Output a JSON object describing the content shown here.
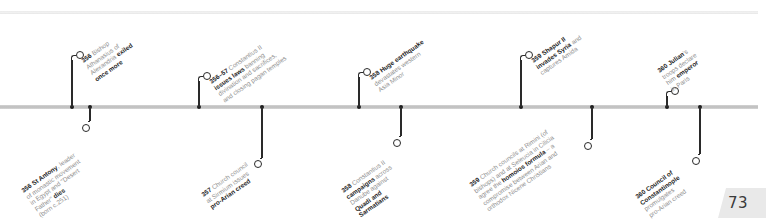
{
  "page": {
    "number": "73"
  },
  "timeline": {
    "above": [
      {
        "x": 72,
        "year": "356",
        "lines": [
          [
            {
              "t": "356",
              "b": true
            },
            {
              "t": " Bishop",
              "b": false
            }
          ],
          [
            {
              "t": "Athanasius of",
              "b": false
            }
          ],
          [
            {
              "t": "Alexandria ",
              "b": false
            },
            {
              "t": "exiled",
              "b": true
            }
          ],
          [
            {
              "t": "once more",
              "b": true
            }
          ]
        ]
      },
      {
        "x": 199,
        "year": "356–57",
        "lines": [
          [
            {
              "t": "356–57",
              "b": true
            },
            {
              "t": " Constantius II",
              "b": false
            }
          ],
          [
            {
              "t": "issues laws",
              "b": true
            },
            {
              "t": " banning",
              "b": false
            }
          ],
          [
            {
              "t": "divination and sacrifices,",
              "b": false
            }
          ],
          [
            {
              "t": "and closing pagan temples",
              "b": false
            }
          ]
        ]
      },
      {
        "x": 359,
        "year": "358",
        "lines": [
          [
            {
              "t": "358",
              "b": true
            },
            {
              "t": " Huge earthquake",
              "b": true
            }
          ],
          [
            {
              "t": "devastates western",
              "b": false
            }
          ],
          [
            {
              "t": "Asia Minor",
              "b": false
            }
          ]
        ]
      },
      {
        "x": 521,
        "year": "359",
        "lines": [
          [
            {
              "t": "359",
              "b": true
            },
            {
              "t": " Shapur II",
              "b": true
            }
          ],
          [
            {
              "t": "invades Syria",
              "b": true
            },
            {
              "t": " and",
              "b": false
            }
          ],
          [
            {
              "t": "captures Amida",
              "b": false
            }
          ]
        ]
      },
      {
        "x": 667,
        "year": "360",
        "lines": [
          [
            {
              "t": "360",
              "b": true
            },
            {
              "t": " Julian",
              "b": true
            },
            {
              "t": "'s",
              "b": false
            }
          ],
          [
            {
              "t": "troops declare",
              "b": false
            }
          ],
          [
            {
              "t": "him ",
              "b": false
            },
            {
              "t": "emperor",
              "b": true
            }
          ],
          [
            {
              "t": "in Paris",
              "b": false
            }
          ]
        ]
      }
    ],
    "below": [
      {
        "x": 90,
        "year": "356",
        "lines": [
          [
            {
              "t": "356",
              "b": true
            },
            {
              "t": " St Antony",
              "b": true
            },
            {
              "t": ", leader",
              "b": false
            }
          ],
          [
            {
              "t": "of monastic movement",
              "b": false
            }
          ],
          [
            {
              "t": "in Egypt and \"Desert",
              "b": false
            }
          ],
          [
            {
              "t": "Father\" ",
              "b": false
            },
            {
              "t": "dies",
              "b": true
            }
          ],
          [
            {
              "t": "(born c.251)",
              "b": false
            }
          ]
        ]
      },
      {
        "x": 262,
        "year": "357",
        "lines": [
          [
            {
              "t": "357",
              "b": true
            },
            {
              "t": " Church council",
              "b": false
            }
          ],
          [
            {
              "t": "at Sirmium issues",
              "b": false
            }
          ],
          [
            {
              "t": "pro-Arian creed",
              "b": true
            }
          ]
        ]
      },
      {
        "x": 401,
        "year": "358",
        "lines": [
          [
            {
              "t": "358",
              "b": true
            },
            {
              "t": " Constantius II",
              "b": false
            }
          ],
          [
            {
              "t": "campaigns",
              "b": true
            },
            {
              "t": " across",
              "b": false
            }
          ],
          [
            {
              "t": "Danube against",
              "b": false
            }
          ],
          [
            {
              "t": "Quadi and",
              "b": true
            }
          ],
          [
            {
              "t": "Sarmatians",
              "b": true
            }
          ]
        ]
      },
      {
        "x": 592,
        "year": "359",
        "lines": [
          [
            {
              "t": "359",
              "b": true
            },
            {
              "t": " Church councils at Rimini (of",
              "b": false
            }
          ],
          [
            {
              "t": "bishops) and at Seleucia in Cilicia",
              "b": false
            }
          ],
          [
            {
              "t": "agree the ",
              "b": false
            },
            {
              "t": "homoios formula",
              "b": true
            },
            {
              "t": " – a",
              "b": false
            }
          ],
          [
            {
              "t": "compromise between Arian and",
              "b": false
            }
          ],
          [
            {
              "t": "orthodox Nicene Christians",
              "b": false
            }
          ]
        ]
      },
      {
        "x": 700,
        "year": "360",
        "lines": [
          [
            {
              "t": "360",
              "b": true
            },
            {
              "t": " Council of",
              "b": true
            }
          ],
          [
            {
              "t": "Constantinople",
              "b": true
            }
          ],
          [
            {
              "t": "promulgates",
              "b": false
            }
          ],
          [
            {
              "t": "pro-Arian creed",
              "b": false
            }
          ]
        ]
      }
    ]
  },
  "layout": {
    "above": [
      {
        "stemTop": 60,
        "ringX": 76,
        "ringY": 51,
        "labelX": 80,
        "labelY": 58
      },
      {
        "stemTop": 81,
        "ringX": 203,
        "ringY": 72,
        "labelX": 208,
        "labelY": 79
      },
      {
        "stemTop": 77,
        "ringX": 363,
        "ringY": 68,
        "labelX": 368,
        "labelY": 75
      },
      {
        "stemTop": 60,
        "ringX": 525,
        "ringY": 51,
        "labelX": 530,
        "labelY": 58
      },
      {
        "stemTop": 96,
        "ringX": 671,
        "ringY": 87,
        "labelX": 656,
        "labelY": 68
      }
    ],
    "below": [
      {
        "stemBottom": 121,
        "ringX": 82,
        "ringY": 124,
        "labelX": 20,
        "labelY": 188
      },
      {
        "stemBottom": 158,
        "ringX": 254,
        "ringY": 160,
        "labelX": 200,
        "labelY": 192
      },
      {
        "stemBottom": 136,
        "ringX": 393,
        "ringY": 139,
        "labelX": 340,
        "labelY": 188
      },
      {
        "stemBottom": 139,
        "ringX": 584,
        "ringY": 142,
        "labelX": 468,
        "labelY": 182
      },
      {
        "stemBottom": 154,
        "ringX": 692,
        "ringY": 157,
        "labelX": 634,
        "labelY": 194
      }
    ]
  }
}
